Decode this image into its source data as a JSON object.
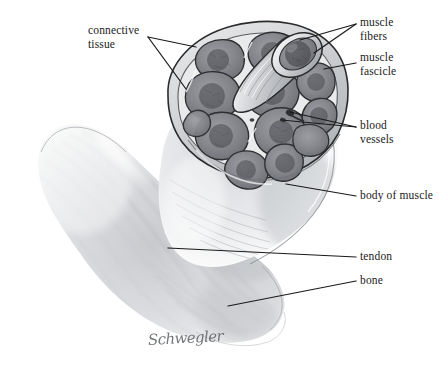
{
  "figure": {
    "signature": "Schwegler",
    "background_color": "#ffffff",
    "ink_color": "#1a1a1a",
    "medium": "graphite pencil drawing",
    "width": 439,
    "height": 380
  },
  "labels": {
    "connective_tissue": "connective\ntissue",
    "muscle_fibers": "muscle\nfibers",
    "muscle_fascicle": "muscle\nfascicle",
    "blood_vessels": "blood\nvessels",
    "body_of_muscle": "body of muscle",
    "tendon": "tendon",
    "bone": "bone"
  },
  "leader_lines": [
    {
      "name": "connective-tissue-leader-a",
      "from": [
        148,
        37
      ],
      "to": [
        196,
        47
      ]
    },
    {
      "name": "connective-tissue-leader-b",
      "from": [
        148,
        37
      ],
      "to": [
        186,
        89
      ]
    },
    {
      "name": "muscle-fibers-leader-a",
      "from": [
        356,
        24
      ],
      "to": [
        300,
        40
      ]
    },
    {
      "name": "muscle-fibers-leader-b",
      "from": [
        356,
        24
      ],
      "to": [
        315,
        52
      ]
    },
    {
      "name": "muscle-fascicle-leader",
      "from": [
        356,
        63
      ],
      "to": [
        325,
        68
      ]
    },
    {
      "name": "blood-vessels-leader-a",
      "from": [
        356,
        127
      ],
      "to": [
        290,
        113
      ]
    },
    {
      "name": "blood-vessels-leader-b",
      "from": [
        356,
        127
      ],
      "to": [
        282,
        120
      ]
    },
    {
      "name": "body-of-muscle-leader",
      "from": [
        356,
        196
      ],
      "to": [
        286,
        184
      ]
    },
    {
      "name": "tendon-leader",
      "from": [
        356,
        257
      ],
      "to": [
        168,
        248
      ]
    },
    {
      "name": "bone-leader",
      "from": [
        356,
        281
      ],
      "to": [
        228,
        306
      ]
    }
  ],
  "anatomy": {
    "cross_section": {
      "name": "muscle-cross-section",
      "fascicle_count": 11,
      "description": "Cut end of muscle showing polygonal fascicles wrapped in connective tissue"
    },
    "protruding_fascicle": {
      "name": "protruding-fascicle",
      "description": "Single cylindrical fascicle pulled out, cut face showing muscle fibers"
    },
    "muscle_belly": {
      "name": "muscle-belly",
      "description": "Soft shaded body of muscle with fibrous striations"
    },
    "tendon_region": {
      "name": "tendon-region",
      "description": "Fibers converging into tendon at lower right"
    }
  }
}
